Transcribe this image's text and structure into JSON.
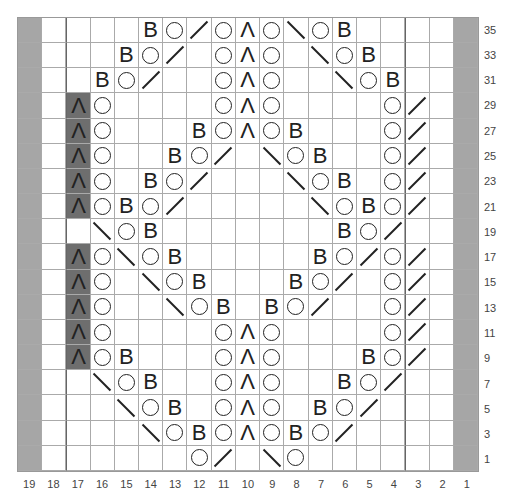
{
  "chart": {
    "columns": [
      "19",
      "18",
      "17",
      "16",
      "15",
      "14",
      "13",
      "12",
      "11",
      "10",
      "9",
      "8",
      "7",
      "6",
      "5",
      "4",
      "3",
      "2",
      "1"
    ],
    "row_labels": [
      "35",
      "33",
      "31",
      "29",
      "27",
      "25",
      "23",
      "21",
      "19",
      "17",
      "15",
      "13",
      "11",
      "9",
      "7",
      "5",
      "3",
      "1"
    ],
    "legend": {
      "G": "gray / no stitch (edge)",
      "D": "dark cell with centered double decrease",
      "O": "yarn over",
      "/": "right-leaning decrease",
      "\\": "left-leaning decrease",
      "Λ": "centered double decrease",
      "B": "twisted stitch",
      "_": "plain knit"
    },
    "rows": [
      [
        "G",
        "_",
        "_",
        "_",
        "_",
        "B",
        "O",
        "/",
        "O",
        "Λ",
        "O",
        "\\",
        "O",
        "B",
        "_",
        "_",
        "_",
        "_",
        "G"
      ],
      [
        "G",
        "_",
        "_",
        "_",
        "B",
        "O",
        "/",
        "_",
        "O",
        "Λ",
        "O",
        "_",
        "\\",
        "O",
        "B",
        "_",
        "_",
        "_",
        "G"
      ],
      [
        "G",
        "_",
        "_",
        "B",
        "O",
        "/",
        "_",
        "_",
        "O",
        "Λ",
        "O",
        "_",
        "_",
        "\\",
        "O",
        "B",
        "_",
        "_",
        "G"
      ],
      [
        "G",
        "_",
        "D",
        "O",
        "_",
        "_",
        "_",
        "_",
        "O",
        "Λ",
        "O",
        "_",
        "_",
        "_",
        "_",
        "O",
        "/",
        "_",
        "G"
      ],
      [
        "G",
        "_",
        "D",
        "O",
        "_",
        "_",
        "_",
        "B",
        "O",
        "Λ",
        "O",
        "B",
        "_",
        "_",
        "_",
        "O",
        "/",
        "_",
        "G"
      ],
      [
        "G",
        "_",
        "D",
        "O",
        "_",
        "_",
        "B",
        "O",
        "/",
        "_",
        "\\",
        "O",
        "B",
        "_",
        "_",
        "O",
        "/",
        "_",
        "G"
      ],
      [
        "G",
        "_",
        "D",
        "O",
        "_",
        "B",
        "O",
        "/",
        "_",
        "_",
        "_",
        "\\",
        "O",
        "B",
        "_",
        "O",
        "/",
        "_",
        "G"
      ],
      [
        "G",
        "_",
        "D",
        "O",
        "B",
        "O",
        "/",
        "_",
        "_",
        "_",
        "_",
        "_",
        "\\",
        "O",
        "B",
        "O",
        "/",
        "_",
        "G"
      ],
      [
        "G",
        "_",
        "_",
        "\\",
        "O",
        "B",
        "_",
        "_",
        "_",
        "_",
        "_",
        "_",
        "_",
        "B",
        "O",
        "/",
        "_",
        "_",
        "G"
      ],
      [
        "G",
        "_",
        "D",
        "O",
        "\\",
        "O",
        "B",
        "_",
        "_",
        "_",
        "_",
        "_",
        "B",
        "O",
        "/",
        "O",
        "/",
        "_",
        "G"
      ],
      [
        "G",
        "_",
        "D",
        "O",
        "_",
        "\\",
        "O",
        "B",
        "_",
        "_",
        "_",
        "B",
        "O",
        "/",
        "_",
        "O",
        "/",
        "_",
        "G"
      ],
      [
        "G",
        "_",
        "D",
        "O",
        "_",
        "_",
        "\\",
        "O",
        "B",
        "_",
        "B",
        "O",
        "/",
        "_",
        "_",
        "O",
        "/",
        "_",
        "G"
      ],
      [
        "G",
        "_",
        "D",
        "O",
        "_",
        "_",
        "_",
        "_",
        "O",
        "Λ",
        "O",
        "_",
        "_",
        "_",
        "_",
        "O",
        "/",
        "_",
        "G"
      ],
      [
        "G",
        "_",
        "D",
        "O",
        "B",
        "_",
        "_",
        "_",
        "O",
        "Λ",
        "O",
        "_",
        "_",
        "_",
        "B",
        "O",
        "/",
        "_",
        "G"
      ],
      [
        "G",
        "_",
        "_",
        "\\",
        "O",
        "B",
        "_",
        "_",
        "O",
        "Λ",
        "O",
        "_",
        "_",
        "B",
        "O",
        "/",
        "_",
        "_",
        "G"
      ],
      [
        "G",
        "_",
        "_",
        "_",
        "\\",
        "O",
        "B",
        "_",
        "O",
        "Λ",
        "O",
        "_",
        "B",
        "O",
        "/",
        "_",
        "_",
        "_",
        "G"
      ],
      [
        "G",
        "_",
        "_",
        "_",
        "_",
        "\\",
        "O",
        "B",
        "O",
        "Λ",
        "O",
        "B",
        "O",
        "/",
        "_",
        "_",
        "_",
        "_",
        "G"
      ],
      [
        "G",
        "_",
        "_",
        "_",
        "_",
        "_",
        "_",
        "O",
        "/",
        "_",
        "\\",
        "O",
        "_",
        "_",
        "_",
        "_",
        "_",
        "_",
        "G"
      ]
    ]
  }
}
